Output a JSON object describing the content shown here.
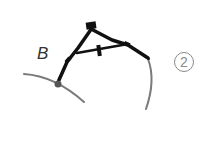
{
  "figure": {
    "point_label": "B",
    "step_number": "2",
    "colors": {
      "arc": "#7a7a7a",
      "compass": "#111111",
      "label": "#333333",
      "badge": "#8a8a8a",
      "background": "#ffffff"
    },
    "elements": {
      "arc_left": "arc through point B",
      "arc_right": "arc drawn by compass pencil tip",
      "compass": "drafting compass with needle at B",
      "point": "point B"
    }
  }
}
